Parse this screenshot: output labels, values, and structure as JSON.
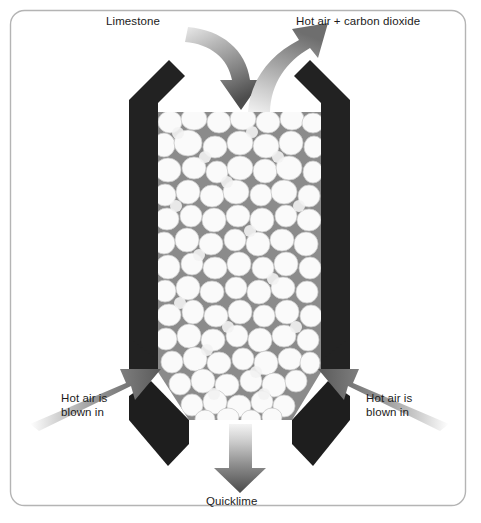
{
  "figure": {
    "frame": {
      "border_color": "#b4b4b4",
      "corner_radius": 14,
      "background": "#ffffff"
    }
  },
  "labels": {
    "limestone": "Limestone",
    "hot_air_carbon_dioxide": "Hot air + carbon dioxide",
    "hot_air_left": "Hot air is\nblown in",
    "hot_air_right": "Hot air is\nblown in",
    "quicklime": "Quicklime"
  },
  "icons": {
    "limestone_arrow": "curved-arrow-down-into-kiln-icon",
    "exhaust_arrow": "curved-arrow-up-out-of-kiln-icon",
    "air_inlet_left_arrow": "arrow-right-up-icon",
    "air_inlet_right_arrow": "arrow-left-up-icon",
    "quicklime_arrow": "arrow-down-icon"
  },
  "colors": {
    "kiln_wall": "#222222",
    "kiln_wall_dark": "#1a1a1a",
    "rock_fill_background": "#8b8b8b",
    "rock_highlight": "#fbfbfb",
    "rock_shadow": "#d2d2d2",
    "arrow_dark": "#4a4a4a",
    "arrow_mid": "#6f6f6f",
    "arrow_light": "#e8e8e8",
    "text": "#1b1b1b",
    "frame_border": "#b4b4b4"
  },
  "geometry": {
    "frame": {
      "x": 10,
      "y": 10,
      "width": 456,
      "height": 496
    },
    "kiln_shaft": {
      "left": 158,
      "right": 321,
      "top": 112,
      "bottom": 372
    },
    "kiln_hopper_bottom_y": 420,
    "kiln_hopper_outlet": {
      "left": 215,
      "right": 265
    },
    "wall_thickness": 22
  }
}
